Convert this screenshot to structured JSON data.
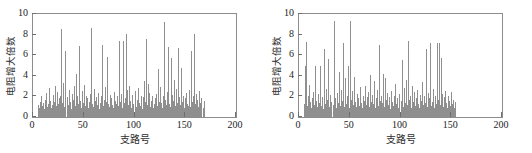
{
  "figure": {
    "background": "#ffffff",
    "bar_color": "#8f8f8f",
    "axis_color": "#8d8d8d"
  },
  "chart_data": [
    {
      "type": "bar",
      "title": "",
      "xlabel": "支路号",
      "ylabel": "电阻增大倍数",
      "xlim": [
        0,
        200
      ],
      "ylim": [
        0,
        10
      ],
      "xticks": [
        0,
        50,
        100,
        150,
        200
      ],
      "yticks": [
        0,
        2,
        4,
        6,
        8,
        10
      ],
      "grid": false,
      "legend": null,
      "x": [
        5,
        6,
        7,
        8,
        9,
        10,
        11,
        12,
        13,
        14,
        15,
        16,
        17,
        18,
        19,
        20,
        21,
        22,
        23,
        24,
        25,
        26,
        27,
        28,
        29,
        30,
        31,
        32,
        33,
        34,
        35,
        36,
        37,
        38,
        39,
        40,
        41,
        42,
        43,
        44,
        45,
        46,
        47,
        48,
        49,
        50,
        51,
        52,
        53,
        54,
        55,
        56,
        57,
        58,
        59,
        60,
        61,
        62,
        63,
        64,
        65,
        66,
        67,
        68,
        69,
        70,
        71,
        72,
        73,
        74,
        75,
        76,
        77,
        78,
        79,
        80,
        81,
        82,
        83,
        84,
        85,
        86,
        87,
        88,
        89,
        90,
        91,
        92,
        93,
        94,
        95,
        96,
        97,
        98,
        99,
        100,
        101,
        102,
        103,
        104,
        105,
        106,
        107,
        108,
        109,
        110,
        111,
        112,
        113,
        114,
        115,
        116,
        117,
        118,
        119,
        120,
        121,
        122,
        123,
        124,
        125,
        126,
        127,
        128,
        129,
        130,
        131,
        132,
        133,
        134,
        135,
        136,
        137,
        138,
        139,
        140,
        141,
        142,
        143,
        144,
        145,
        146,
        147,
        148,
        149,
        150,
        151,
        152,
        153,
        154,
        155,
        156,
        157,
        158,
        159,
        160,
        161,
        162,
        163,
        164,
        165,
        166,
        167,
        168,
        169,
        170
      ],
      "values": [
        1.2,
        0.9,
        1.5,
        2.0,
        1.1,
        1.4,
        0.8,
        1.7,
        2.3,
        1.0,
        1.3,
        2.8,
        1.6,
        0.9,
        1.2,
        2.1,
        1.5,
        3.0,
        1.1,
        2.4,
        1.3,
        1.8,
        2.0,
        8.5,
        1.4,
        3.3,
        1.0,
        6.4,
        1.9,
        1.2,
        2.6,
        1.5,
        0.8,
        2.2,
        1.7,
        3.0,
        1.1,
        4.2,
        2.0,
        1.3,
        6.9,
        1.6,
        0.9,
        2.5,
        1.4,
        3.1,
        1.1,
        2.0,
        1.8,
        0.9,
        1.5,
        2.2,
        8.6,
        1.3,
        1.0,
        2.7,
        1.6,
        1.9,
        1.2,
        2.3,
        0.8,
        1.4,
        2.0,
        7.0,
        1.1,
        1.7,
        2.9,
        1.5,
        5.8,
        1.3,
        1.0,
        2.1,
        1.8,
        1.2,
        0.9,
        2.4,
        1.6,
        1.3,
        2.0,
        1.1,
        7.4,
        1.5,
        2.2,
        0.9,
        7.4,
        1.4,
        1.8,
        8.1,
        2.6,
        1.2,
        3.0,
        1.6,
        0.9,
        2.1,
        1.3,
        2.5,
        1.0,
        1.7,
        2.8,
        1.4,
        1.1,
        2.0,
        0.8,
        1.9,
        3.5,
        1.5,
        7.6,
        1.2,
        3.2,
        2.3,
        1.0,
        1.6,
        2.0,
        0.9,
        1.3,
        1.8,
        2.2,
        1.1,
        4.7,
        1.5,
        2.9,
        1.4,
        0.9,
        2.0,
        9.2,
        1.7,
        1.2,
        2.4,
        6.8,
        1.3,
        1.0,
        5.7,
        2.1,
        1.6,
        3.6,
        1.1,
        2.7,
        1.4,
        6.7,
        1.9,
        1.2,
        4.8,
        1.5,
        2.0,
        0.9,
        1.8,
        2.3,
        1.3,
        1.1,
        2.6,
        1.0,
        6.4,
        1.5,
        2.0,
        8.1,
        1.3,
        2.2,
        1.7,
        1.0,
        2.5,
        1.4,
        1.8,
        0.9,
        1.6
      ]
    },
    {
      "type": "bar",
      "title": "",
      "xlabel": "支路号",
      "ylabel": "电阻增大倍数",
      "xlim": [
        0,
        200
      ],
      "ylim": [
        0,
        10
      ],
      "xticks": [
        0,
        50,
        100,
        150,
        200
      ],
      "yticks": [
        0,
        2,
        4,
        6,
        8,
        10
      ],
      "grid": false,
      "legend": null,
      "x": [
        5,
        6,
        7,
        8,
        9,
        10,
        11,
        12,
        13,
        14,
        15,
        16,
        17,
        18,
        19,
        20,
        21,
        22,
        23,
        24,
        25,
        26,
        27,
        28,
        29,
        30,
        31,
        32,
        33,
        34,
        35,
        36,
        37,
        38,
        39,
        40,
        41,
        42,
        43,
        44,
        45,
        46,
        47,
        48,
        49,
        50,
        51,
        52,
        53,
        54,
        55,
        56,
        57,
        58,
        59,
        60,
        61,
        62,
        63,
        64,
        65,
        66,
        67,
        68,
        69,
        70,
        71,
        72,
        73,
        74,
        75,
        76,
        77,
        78,
        79,
        80,
        81,
        82,
        83,
        84,
        85,
        86,
        87,
        88,
        89,
        90,
        91,
        92,
        93,
        94,
        95,
        96,
        97,
        98,
        99,
        100,
        101,
        102,
        103,
        104,
        105,
        106,
        107,
        108,
        109,
        110,
        111,
        112,
        113,
        114,
        115,
        116,
        117,
        118,
        119,
        120,
        121,
        122,
        123,
        124,
        125,
        126,
        127,
        128,
        129,
        130,
        131,
        132,
        133,
        134,
        135,
        136,
        137,
        138,
        139,
        140,
        141,
        142,
        143,
        144,
        145,
        146,
        147,
        148,
        149,
        150,
        151,
        152,
        153,
        154,
        155,
        156,
        157,
        158,
        159,
        160,
        161,
        162,
        163,
        164,
        165,
        166,
        167,
        168,
        169,
        170
      ],
      "values": [
        1.3,
        5.0,
        7.3,
        1.1,
        2.0,
        3.1,
        1.5,
        0.9,
        1.8,
        2.4,
        1.2,
        5.0,
        1.6,
        1.0,
        2.2,
        1.4,
        5.0,
        1.1,
        1.9,
        0.8,
        6.6,
        1.3,
        2.7,
        1.7,
        5.6,
        1.0,
        2.1,
        1.5,
        1.2,
        9.3,
        1.8,
        0.9,
        2.3,
        1.4,
        4.4,
        1.1,
        2.6,
        1.6,
        7.2,
        1.0,
        3.8,
        1.3,
        2.0,
        5.0,
        0.9,
        9.3,
        1.7,
        2.5,
        1.2,
        3.9,
        1.5,
        1.0,
        2.2,
        1.8,
        1.1,
        2.9,
        1.4,
        0.9,
        2.0,
        1.6,
        3.0,
        1.2,
        1.9,
        2.4,
        1.0,
        4.1,
        1.5,
        2.1,
        1.3,
        3.5,
        0.9,
        1.8,
        2.6,
        1.1,
        7.0,
        1.6,
        2.0,
        1.4,
        4.2,
        1.0,
        3.8,
        1.7,
        2.3,
        1.2,
        1.9,
        0.8,
        2.5,
        1.5,
        1.1,
        2.0,
        3.2,
        1.3,
        1.8,
        0.9,
        2.2,
        1.6,
        5.5,
        1.0,
        2.8,
        1.4,
        3.6,
        1.2,
        7.4,
        1.7,
        2.0,
        0.9,
        3.0,
        1.5,
        2.4,
        1.1,
        1.8,
        2.6,
        1.3,
        0.9,
        2.1,
        1.6,
        3.4,
        1.2,
        2.0,
        1.4,
        6.6,
        1.0,
        2.3,
        1.8,
        7.2,
        1.1,
        1.5,
        2.7,
        0.9,
        2.0,
        1.3,
        7.2,
        1.7,
        7.2,
        1.2,
        5.7,
        2.2,
        1.0,
        1.9,
        2.5,
        1.4,
        0.9,
        2.0,
        1.6,
        1.1,
        2.4,
        1.3,
        1.7,
        0.9,
        1.5
      ]
    }
  ]
}
